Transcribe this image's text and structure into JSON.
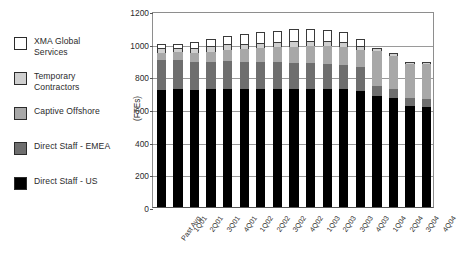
{
  "chart_data": {
    "type": "bar",
    "barmode": "stacked",
    "title": "",
    "xlabel": "",
    "ylabel": "(FTEs)",
    "ylim": [
      0,
      1200
    ],
    "ytick_step": 200,
    "yticks": [
      0,
      200,
      400,
      600,
      800,
      1000,
      1200
    ],
    "grid": true,
    "legend_position": "left-outside",
    "categories": [
      "Past Avg",
      "1Q01",
      "2Q01",
      "3Q01",
      "4Q01",
      "1Q02",
      "2Q02",
      "3Q02",
      "4Q02",
      "1Q03",
      "2Q03",
      "3Q03",
      "4Q03",
      "1Q04",
      "2Q04",
      "3Q04",
      "4Q04"
    ],
    "series": [
      {
        "name": "Direct Staff - US",
        "color": "#000000",
        "values": [
          715,
          720,
          715,
          720,
          725,
          725,
          725,
          725,
          725,
          725,
          725,
          720,
          710,
          680,
          670,
          620,
          615
        ]
      },
      {
        "name": "Direct Staff - EMEA",
        "color": "#6e6e6e",
        "values": [
          185,
          180,
          175,
          170,
          168,
          165,
          162,
          160,
          158,
          155,
          152,
          150,
          145,
          60,
          55,
          50,
          45
        ]
      },
      {
        "name": "Captive Offshore",
        "color": "#a8a8a8",
        "values": [
          45,
          48,
          55,
          62,
          70,
          78,
          85,
          92,
          98,
          105,
          110,
          112,
          108,
          215,
          200,
          205,
          215
        ]
      },
      {
        "name": "Temporary Contractors",
        "color": "#cfcfcf",
        "values": [
          30,
          28,
          30,
          32,
          33,
          33,
          33,
          33,
          33,
          33,
          32,
          30,
          25,
          20,
          18,
          12,
          10
        ]
      },
      {
        "name": "XMA Global Services",
        "color": "#ffffff",
        "values": [
          25,
          24,
          35,
          46,
          54,
          59,
          65,
          70,
          75,
          72,
          68,
          58,
          42,
          0,
          0,
          0,
          0
        ]
      }
    ],
    "totals": [
      1000,
      1000,
      1010,
      1030,
      1050,
      1060,
      1070,
      1080,
      1089,
      1090,
      1087,
      1070,
      1030,
      975,
      943,
      887,
      885
    ]
  },
  "legend": {
    "items": [
      {
        "label": "XMA Global\nServices",
        "color": "#ffffff",
        "name": "xma-global-services"
      },
      {
        "label": "Temporary\nContractors",
        "color": "#cfcfcf",
        "name": "temporary-contractors"
      },
      {
        "label": "Captive Offshore",
        "color": "#a8a8a8",
        "name": "captive-offshore"
      },
      {
        "label": "Direct Staff - EMEA",
        "color": "#6e6e6e",
        "name": "direct-staff-emea"
      },
      {
        "label": "Direct Staff - US",
        "color": "#000000",
        "name": "direct-staff-us"
      }
    ]
  },
  "axis": {
    "y_title": "(FTEs)"
  }
}
